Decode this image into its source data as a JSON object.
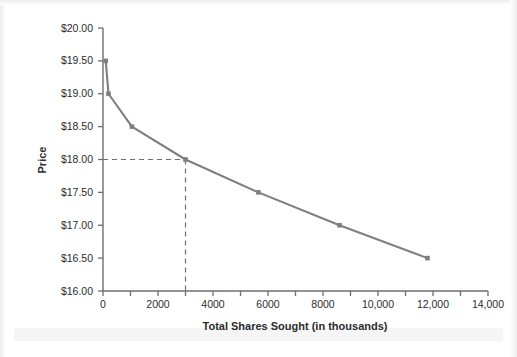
{
  "figure": {
    "background_color": "#ffffff",
    "series_color": "#7f7f7f",
    "axis_color": "#6e6e6e",
    "text_color": "#2b2b2b",
    "guide_color": "#6e6e6e"
  },
  "chart_data": {
    "type": "line",
    "title": "",
    "xlabel": "Total Shares Sought (in thousands)",
    "ylabel": "Price",
    "xlim": [
      0,
      14000
    ],
    "ylim": [
      16.0,
      20.0
    ],
    "grid": false,
    "legend": false,
    "x_ticks": [
      0,
      1000,
      2000,
      3000,
      4000,
      5000,
      6000,
      7000,
      8000,
      9000,
      10000,
      11000,
      12000,
      13000,
      14000
    ],
    "x_tick_labels": [
      "0",
      "",
      "2000",
      "",
      "4000",
      "",
      "6000",
      "",
      "8000",
      "",
      "10,000",
      "",
      "12,000",
      "",
      "14,000"
    ],
    "y_ticks": [
      16.0,
      16.5,
      17.0,
      17.5,
      18.0,
      18.5,
      19.0,
      19.5,
      20.0
    ],
    "y_tick_labels": [
      "$16.00",
      "$16.50",
      "$17.00",
      "$17.50",
      "$18.00",
      "$18.50",
      "$19.00",
      "$19.50",
      "$20.00"
    ],
    "series": [
      {
        "name": "Demand curve",
        "x": [
          100,
          200,
          1050,
          3000,
          5650,
          8600,
          11800
        ],
        "y": [
          19.5,
          19.0,
          18.5,
          18.0,
          17.5,
          17.0,
          16.5
        ],
        "marker": "square",
        "line_style": "solid"
      }
    ],
    "annotations": [
      {
        "type": "guide-lines",
        "style": "dashed",
        "x": 3000,
        "y": 18.0,
        "description": "Dashed guide lines from y-axis at $18.00 across to the curve, then down to x = 3000"
      }
    ]
  },
  "axis": {
    "x_title": "Total Shares Sought (in thousands)",
    "y_title": "Price"
  }
}
